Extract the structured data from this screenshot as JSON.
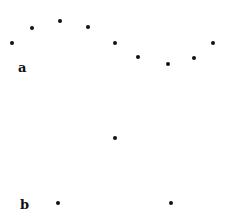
{
  "panels": [
    {
      "label": "a",
      "label_pos": [
        22,
        69
      ],
      "points": [
        [
          12,
          43
        ],
        [
          32,
          28
        ],
        [
          60,
          21
        ],
        [
          88,
          27
        ],
        [
          115,
          43
        ],
        [
          138,
          57
        ],
        [
          168,
          64
        ],
        [
          194,
          58
        ],
        [
          213,
          43
        ]
      ]
    },
    {
      "label": "b",
      "label_pos": [
        24,
        206
      ],
      "points": [
        [
          115,
          138
        ],
        [
          58,
          203
        ],
        [
          171,
          203
        ]
      ]
    }
  ]
}
